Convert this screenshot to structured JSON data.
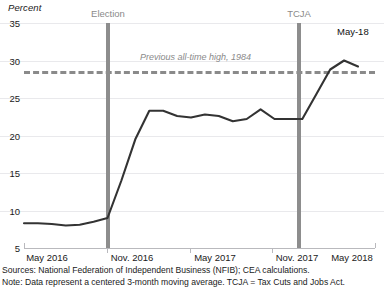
{
  "chart_data": {
    "type": "line",
    "title": "",
    "ylabel": "Percent",
    "xlabel": "",
    "ylim": [
      5,
      35
    ],
    "ytick_labels": [
      "35",
      "30",
      "25",
      "20",
      "15",
      "10",
      "5"
    ],
    "ytick_values": [
      35,
      30,
      25,
      20,
      15,
      10,
      5
    ],
    "xtick_labels": [
      "May 2016",
      "Nov. 2016",
      "May 2017",
      "Nov. 2017",
      "May 2018"
    ],
    "grid": true,
    "legend": "none",
    "series": [
      {
        "name": "Share of small businesses citing taxes/regulation optimism",
        "color": "#333333",
        "x": [
          "May 2016",
          "Jun 2016",
          "Jul 2016",
          "Aug 2016",
          "Sep 2016",
          "Oct 2016",
          "Nov. 2016",
          "Dec 2016",
          "Jan 2017",
          "Feb 2017",
          "Mar 2017",
          "Apr 2017",
          "May 2017",
          "Jun 2017",
          "Jul 2017",
          "Aug 2017",
          "Sep 2017",
          "Oct 2017",
          "Nov. 2017",
          "Dec 2017",
          "Jan 2018",
          "Feb 2018",
          "Mar 2018",
          "Apr 2018",
          "May 2018"
        ],
        "values": [
          8.3,
          8.3,
          8.2,
          8.0,
          8.1,
          8.5,
          9.0,
          14.0,
          19.5,
          23.3,
          23.3,
          22.6,
          22.4,
          22.8,
          22.6,
          21.9,
          22.2,
          23.5,
          22.2,
          22.2,
          22.2,
          25.5,
          28.8,
          30.0,
          29.2
        ]
      }
    ],
    "reference_line": {
      "label": "Previous all-time high, 1984",
      "value": 28.0,
      "style": "dashed",
      "color": "#8a8a8a"
    },
    "event_markers": [
      {
        "label": "Election",
        "x": "Nov. 2016",
        "color": "#8d8d8d"
      },
      {
        "label": "TCJA",
        "x": "Dec 2017",
        "color": "#8d8d8d"
      }
    ],
    "annotations": [
      {
        "label": "May-18",
        "x": "May 2018",
        "placement": "top-right"
      }
    ],
    "sources_note": "Sources: National Federation of Independent Business (NFIB); CEA calculations.",
    "data_note": "Note: Data represent a centered 3-month moving average. TCJA = Tax Cuts and Jobs Act."
  },
  "axis": {
    "y_title": "Percent",
    "y_labels": [
      "35",
      "30",
      "25",
      "20",
      "15",
      "10",
      "5"
    ],
    "x_labels": [
      "May 2016",
      "Nov. 2016",
      "May 2017",
      "Nov. 2017",
      "May 2018"
    ]
  },
  "markers": {
    "election": "Election",
    "tcja": "TCJA",
    "reference": "Previous all-time high, 1984",
    "end_point": "May-18"
  },
  "footnotes": {
    "sources": "Sources: National Federation of Independent Business (NFIB); CEA calculations.",
    "note": "Note: Data represent a centered 3-month moving average. TCJA = Tax Cuts and Jobs Act."
  },
  "colors": {
    "line": "#333333",
    "grid": "#e9e9ec",
    "event_bar": "#8d8d8d",
    "reference_line": "#8a8a8a",
    "axis": "#b9b9bd"
  }
}
